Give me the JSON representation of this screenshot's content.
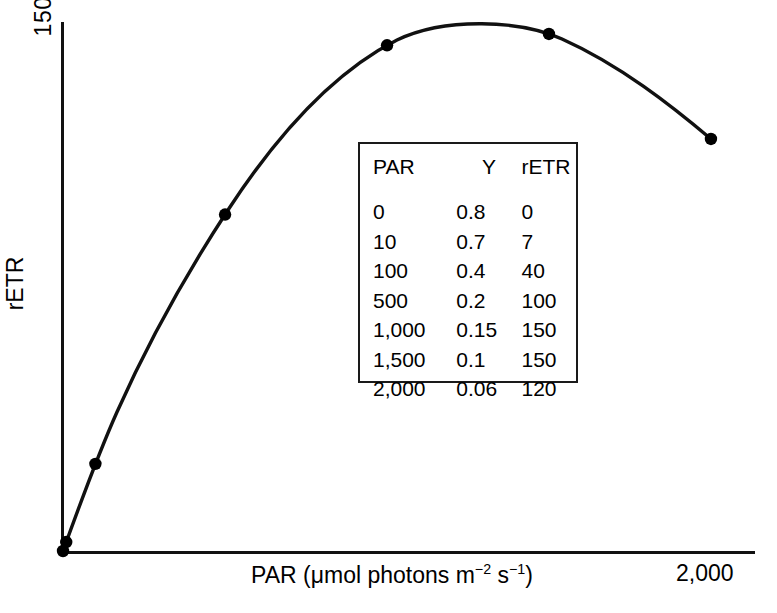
{
  "chart_data": {
    "type": "line",
    "title": "",
    "subtitle": "",
    "xlabel": "PAR (μmol photons m−2 s−1)",
    "xlabel_parts": {
      "prefix": "PAR (μmol photons m",
      "exp1": "−2",
      "mid": " s",
      "exp2": "−1",
      "suffix": ")"
    },
    "ylabel": "rETR",
    "xlim": [
      0,
      2000
    ],
    "ylim": [
      0,
      160
    ],
    "grid": false,
    "legend": "none",
    "x_tick_labels": [
      "2,000"
    ],
    "y_tick_labels": [
      "150"
    ],
    "x": [
      0,
      10,
      100,
      500,
      1000,
      1500,
      2000
    ],
    "y": [
      0,
      7,
      40,
      100,
      150,
      150,
      120
    ],
    "series": [
      {
        "name": "rETR vs PAR",
        "x": [
          0,
          10,
          100,
          500,
          1000,
          1500,
          2000
        ],
        "values": [
          0,
          7,
          40,
          100,
          150,
          150,
          120
        ],
        "marker": "filled-circle",
        "line": "solid-black"
      }
    ],
    "annotations": []
  },
  "axes": {
    "y_tick_150": "150",
    "y_axis_title": "rETR",
    "x_tick_2000": "2,000"
  },
  "table": {
    "headers": [
      "PAR",
      "Y",
      "rETR"
    ],
    "rows": [
      [
        "0",
        "0.8",
        "0"
      ],
      [
        "10",
        "0.7",
        "7"
      ],
      [
        "100",
        "0.4",
        "40"
      ],
      [
        "500",
        "0.2",
        "100"
      ],
      [
        "1,000",
        "0.15",
        "150"
      ],
      [
        "1,500",
        "0.1",
        "150"
      ],
      [
        "2,000",
        "0.06",
        "120"
      ]
    ]
  },
  "colors": {
    "line": "#111111",
    "marker": "#000000",
    "axis": "#111111",
    "table_border": "#1a1a1a",
    "background": "#ffffff"
  }
}
